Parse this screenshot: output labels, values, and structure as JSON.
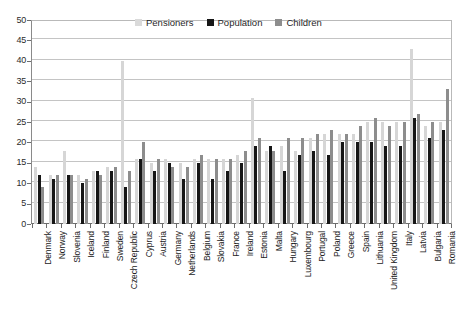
{
  "chart_data": {
    "type": "bar",
    "title": "",
    "xlabel": "",
    "ylabel": "",
    "ylim": [
      0,
      50
    ],
    "ytick_step": 5,
    "grid": true,
    "legend_position": "top-center",
    "categories": [
      "Denmark",
      "Norway",
      "Slovenia",
      "Iceland",
      "Finland",
      "Sweden",
      "Czech Republic",
      "Cyprus",
      "Austria",
      "Germany",
      "Netherlands",
      "Belgium",
      "Slovakia",
      "France",
      "Ireland",
      "Estonia",
      "Malta",
      "Hungary",
      "Luxembourg",
      "Portugal",
      "Poland",
      "Greece",
      "Spain",
      "Lithuania",
      "United Kingdom",
      "Italy",
      "Latvia",
      "Bulgaria",
      "Romania"
    ],
    "series": [
      {
        "name": "Pensioners",
        "color": "#d6d6d6",
        "values": [
          14,
          12,
          18,
          12,
          13,
          14,
          40,
          16,
          15,
          16,
          15,
          16,
          16,
          16,
          17,
          31,
          18,
          19,
          18,
          21,
          22,
          22,
          22,
          25,
          25,
          25,
          43,
          24,
          25
        ]
      },
      {
        "name": "Population",
        "color": "#161616",
        "values": [
          12,
          11,
          12,
          10,
          13,
          13,
          9,
          16,
          13,
          15,
          11,
          15,
          11,
          13,
          15,
          19,
          19,
          13,
          17,
          18,
          17,
          20,
          20,
          20,
          19,
          19,
          26,
          21,
          23
        ]
      },
      {
        "name": "Children",
        "color": "#8d8d8d",
        "values": [
          9,
          12,
          12,
          11,
          12,
          14,
          13,
          20,
          16,
          14,
          14,
          17,
          16,
          16,
          18,
          21,
          18,
          21,
          21,
          22,
          23,
          22,
          24,
          26,
          24,
          25,
          27,
          25,
          33
        ]
      }
    ],
    "ytick_labels": [
      "0",
      "5",
      "10",
      "15",
      "20",
      "25",
      "30",
      "35",
      "40",
      "45",
      "50"
    ]
  },
  "legend": {
    "items": [
      {
        "label": "Pensioners"
      },
      {
        "label": "Population"
      },
      {
        "label": "Children"
      }
    ]
  }
}
